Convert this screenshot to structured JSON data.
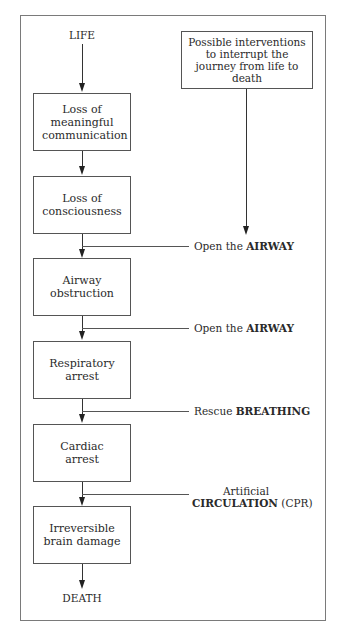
{
  "diagram": {
    "start": "LIFE",
    "end": "DEATH",
    "interventions_box": "Possible interventions to interrupt the journey from life to death",
    "stages": [
      {
        "label": "Loss of meaningful communication"
      },
      {
        "label": "Loss of consciousness"
      },
      {
        "label": "Airway obstruction"
      },
      {
        "label": "Respiratory arrest"
      },
      {
        "label": "Cardiac arrest"
      },
      {
        "label": "Irreversible brain damage"
      }
    ],
    "interventions": [
      {
        "prefix": "Open the",
        "bold": "AIRWAY",
        "suffix": ""
      },
      {
        "prefix": "Open the",
        "bold": "AIRWAY",
        "suffix": ""
      },
      {
        "prefix": "Rescue",
        "bold": "BREATHING",
        "suffix": ""
      },
      {
        "prefix": "Artificial",
        "bold": "CIRCULATION",
        "suffix": "(CPR)"
      }
    ]
  }
}
